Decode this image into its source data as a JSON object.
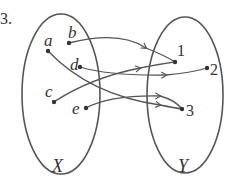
{
  "problem_number": "3.",
  "sets": {
    "domain": {
      "name": "X",
      "elements": [
        "a",
        "b",
        "c",
        "d",
        "e"
      ]
    },
    "codomain": {
      "name": "Y",
      "elements": [
        "1",
        "2",
        "3"
      ]
    }
  },
  "mapping": [
    {
      "from": "b",
      "to": "1"
    },
    {
      "from": "c",
      "to": "1"
    },
    {
      "from": "d",
      "to": "2"
    },
    {
      "from": "a",
      "to": "3"
    },
    {
      "from": "e",
      "to": "3"
    }
  ],
  "labels": {
    "a": "a",
    "b": "b",
    "c": "c",
    "d": "d",
    "e": "e",
    "y1": "1",
    "y2": "2",
    "y3": "3",
    "X": "X",
    "Y": "Y"
  },
  "colors": {
    "stroke": "#555555",
    "text": "#333333"
  }
}
